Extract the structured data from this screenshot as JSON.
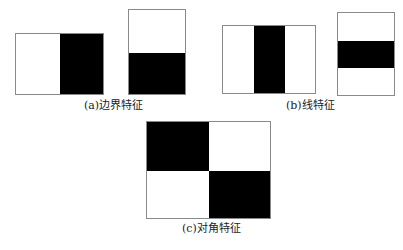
{
  "figure": {
    "panels": [
      {
        "id": "a",
        "caption": "(a)边界特征",
        "features": [
          "horizontal-edge",
          "vertical-edge"
        ]
      },
      {
        "id": "b",
        "caption": "(b)线特征",
        "features": [
          "vertical-line",
          "horizontal-line"
        ]
      },
      {
        "id": "c",
        "caption": "(c)对角特征",
        "features": [
          "diagonal"
        ]
      }
    ],
    "colors": {
      "dark": "#000000",
      "light": "#ffffff",
      "border": "#8a8a8a"
    }
  }
}
